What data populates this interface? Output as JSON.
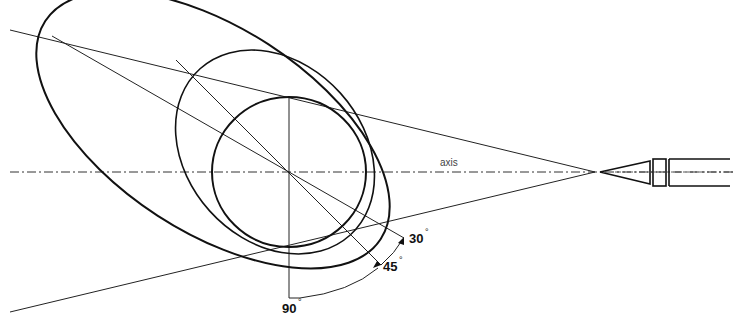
{
  "diagram": {
    "axis_label": "axis",
    "angles": [
      {
        "label": "30",
        "unit": "°"
      },
      {
        "label": "45",
        "unit": "°"
      },
      {
        "label": "90",
        "unit": "°"
      }
    ],
    "colors": {
      "stroke": "#111111",
      "thin_line": "#333333",
      "background": "#ffffff"
    }
  }
}
